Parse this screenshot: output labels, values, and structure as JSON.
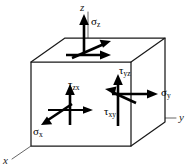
{
  "figure": {
    "type": "engineering-stress-element",
    "background_color": "#ffffff",
    "line_color": "#1a1a1a",
    "axis_color": "#555555",
    "arrow_color": "#000000"
  },
  "axes": [
    {
      "id": "z",
      "label": "z",
      "symbol": "z",
      "direction": "up"
    },
    {
      "id": "y",
      "label": "y",
      "symbol": "y",
      "direction": "right"
    },
    {
      "id": "x",
      "label": "x",
      "symbol": "x",
      "direction": "down-left"
    }
  ],
  "stresses": [
    {
      "id": "sigma-z",
      "glyph": "σ",
      "subscript": "z",
      "label": "σz",
      "kind": "normal",
      "face": "top",
      "direction": "up"
    },
    {
      "id": "sigma-y",
      "glyph": "σ",
      "subscript": "y",
      "label": "σy",
      "kind": "normal",
      "face": "right",
      "direction": "right"
    },
    {
      "id": "sigma-x",
      "glyph": "σ",
      "subscript": "x",
      "label": "σx",
      "kind": "normal",
      "face": "front",
      "direction": "down-left"
    },
    {
      "id": "tau-zx",
      "glyph": "τ",
      "subscript": "zx",
      "label": "τzx",
      "kind": "shear",
      "face": "front",
      "direction": "up"
    },
    {
      "id": "tau-yz",
      "glyph": "τ",
      "subscript": "yz",
      "label": "τyz",
      "kind": "shear",
      "face": "right",
      "direction": "up"
    },
    {
      "id": "tau-xy",
      "glyph": "τ",
      "subscript": "xy",
      "label": "τxy",
      "kind": "shear",
      "face": "right",
      "direction": "up-left"
    }
  ]
}
